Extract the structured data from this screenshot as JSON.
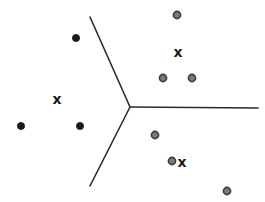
{
  "figure": {
    "width": 265,
    "height": 202,
    "background_color": "#ffffff"
  },
  "chart_data": {
    "type": "scatter",
    "title": "",
    "subtitle": "",
    "xlabel": "",
    "ylabel": "",
    "xlim": [
      0,
      265
    ],
    "ylim": [
      0,
      202
    ],
    "grid": false,
    "axes_visible": false,
    "legend": {
      "visible": false,
      "position": "none",
      "entries": [
        {
          "name": "Class A filled dots",
          "marker": "filled-circle",
          "color": "#1a1a1a"
        },
        {
          "name": "Class B ring dots",
          "marker": "outlined-circle",
          "color": "#6e6e6e"
        },
        {
          "name": "Cluster centers",
          "marker": "x",
          "color": "#1a1a1a"
        }
      ]
    },
    "series": [
      {
        "name": "Class A filled dots",
        "marker": "filled-circle",
        "color": "#1a1a1a",
        "edge_color": "#1a1a1a",
        "radius": 3.6,
        "points": [
          {
            "x": 76,
            "y": 38
          },
          {
            "x": 21,
            "y": 126
          },
          {
            "x": 80,
            "y": 126
          }
        ]
      },
      {
        "name": "Class B ring dots",
        "marker": "outlined-circle",
        "color": "#7a7a7a",
        "edge_color": "#3d3d3d",
        "radius": 3.6,
        "points": [
          {
            "x": 177,
            "y": 15
          },
          {
            "x": 163,
            "y": 78
          },
          {
            "x": 192,
            "y": 78
          },
          {
            "x": 155,
            "y": 135
          },
          {
            "x": 172,
            "y": 161
          },
          {
            "x": 227,
            "y": 191
          }
        ]
      },
      {
        "name": "Cluster centers",
        "marker": "x",
        "color": "#1a1a1a",
        "glyph": "x",
        "size": 14,
        "points": [
          {
            "x": 57,
            "y": 99
          },
          {
            "x": 178,
            "y": 52
          },
          {
            "x": 182,
            "y": 162
          }
        ]
      }
    ],
    "annotations": {
      "boundary": {
        "name": "decision-boundary",
        "type": "polyline-set",
        "color": "#2b2b2b",
        "stroke_width": 1.6,
        "vertex": {
          "x": 130,
          "y": 107
        },
        "segments": [
          {
            "name": "upper-left-branch",
            "x1": 90,
            "y1": 17,
            "x2": 130,
            "y2": 107
          },
          {
            "name": "lower-left-branch",
            "x1": 130,
            "y1": 107,
            "x2": 90,
            "y2": 186
          },
          {
            "name": "right-branch",
            "x1": 130,
            "y1": 107,
            "x2": 258,
            "y2": 108
          }
        ]
      }
    }
  }
}
